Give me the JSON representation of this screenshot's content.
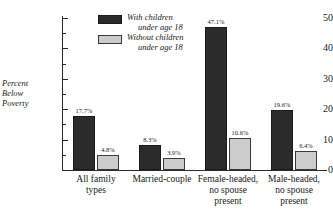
{
  "chart_data": {
    "type": "bar",
    "title": "",
    "xlabel": "",
    "ylabel": "Percent Below Poverty",
    "ylim": [
      0,
      50
    ],
    "ytick_values": [
      0,
      10,
      20,
      30,
      40,
      50
    ],
    "ytick_labels": [
      "0",
      "10",
      "20",
      "30",
      "40",
      "50"
    ],
    "yminor_values": [
      5,
      15,
      25,
      35,
      45
    ],
    "grid": false,
    "legend_position": "upper-left-inside",
    "categories": [
      "All family types",
      "Married-couple",
      "Female-headed, no spouse present",
      "Male-headed, no spouse present"
    ],
    "category_lines": [
      [
        "All family",
        "types"
      ],
      [
        "Married-couple"
      ],
      [
        "Female-headed,",
        "no spouse",
        "present"
      ],
      [
        "Male-headed,",
        "no spouse",
        "present"
      ]
    ],
    "series": [
      {
        "name": "With children under age 18",
        "name_lines": [
          "With children",
          "under age 18"
        ],
        "color": "#2b2b2b",
        "values": [
          17.7,
          8.3,
          47.1,
          19.6
        ],
        "labels": [
          "17.7%",
          "8.3%",
          "47.1%",
          "19.6%"
        ]
      },
      {
        "name": "Without children under age 18",
        "name_lines": [
          "Without children",
          "under age 18"
        ],
        "color": "#cccccc",
        "values": [
          4.8,
          3.9,
          10.6,
          6.4
        ],
        "labels": [
          "4.8%",
          "3.9%",
          "10.6%",
          "6.4%"
        ]
      }
    ]
  },
  "axis": {
    "y_title_lines": [
      "Percent",
      "Below",
      "Poverty"
    ]
  },
  "colors": {
    "bar_dark": "#2b2b2b",
    "bar_light": "#cccccc",
    "bar_light_border": "#3a3a3a",
    "axis": "#2b2b2b",
    "text": "#1a1a1a",
    "background": "#ffffff"
  }
}
